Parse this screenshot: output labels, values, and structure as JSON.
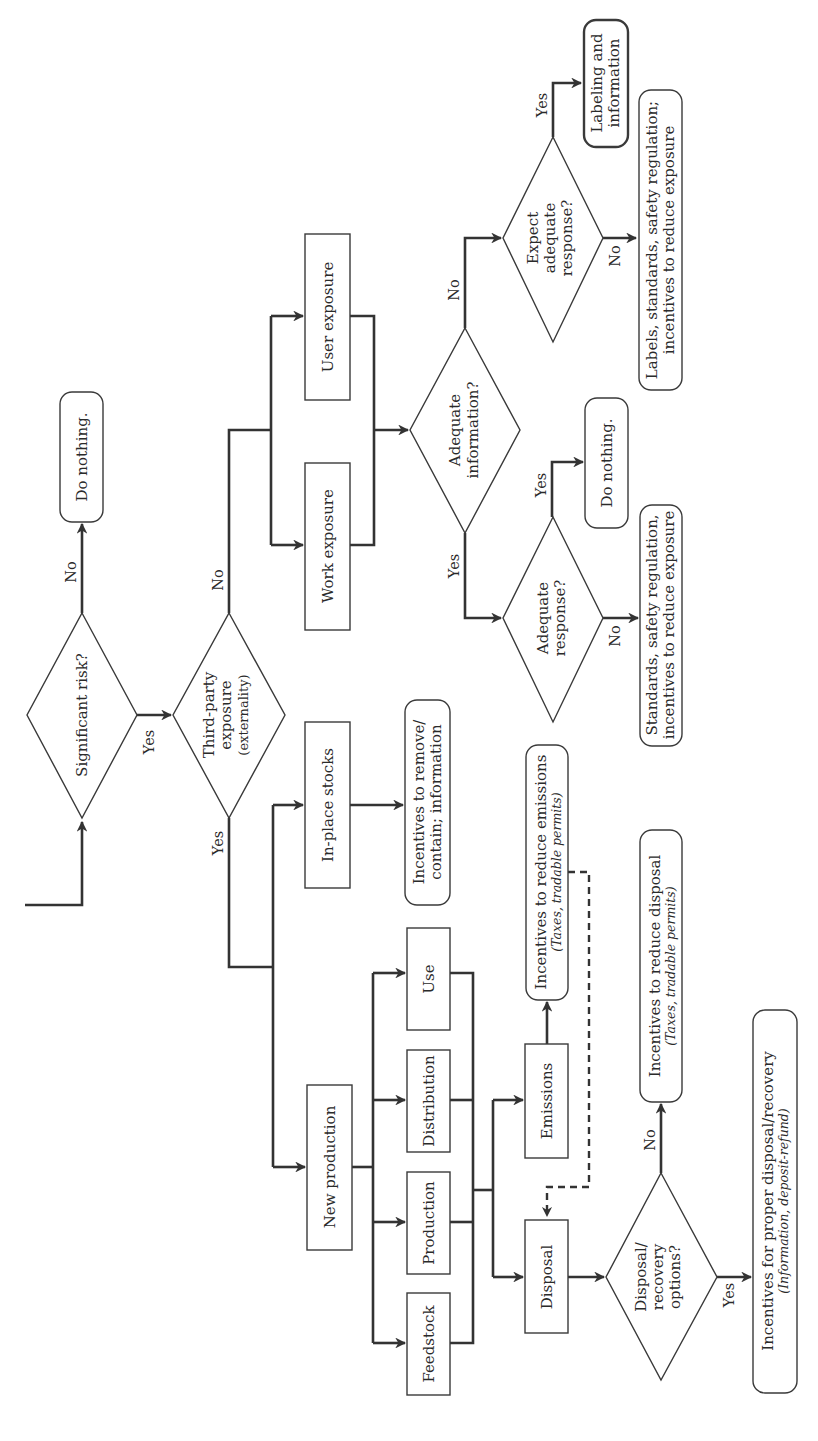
{
  "figure": {
    "orientation": "rotated 90 degrees counter-clockwise",
    "nodes": {
      "significant_risk": {
        "type": "decision",
        "lines": [
          "Significant risk?"
        ]
      },
      "do_nothing_1": {
        "type": "terminal",
        "lines": [
          "Do nothing."
        ]
      },
      "third_party": {
        "type": "decision",
        "lines": [
          "Third-party",
          "exposure",
          "(externality)"
        ]
      },
      "work_exposure": {
        "type": "process",
        "lines": [
          "Work exposure"
        ]
      },
      "user_exposure": {
        "type": "process",
        "lines": [
          "User exposure"
        ]
      },
      "adequate_information": {
        "type": "decision",
        "lines": [
          "Adequate",
          "information?"
        ]
      },
      "expect_adequate_response": {
        "type": "decision",
        "lines": [
          "Expect",
          "adequate",
          "response?"
        ]
      },
      "labeling_information": {
        "type": "terminal",
        "lines": [
          "Labeling and",
          "information"
        ]
      },
      "labels_standards": {
        "type": "terminal",
        "lines": [
          "Labels, standards, safety regulation;",
          "incentives to reduce exposure"
        ]
      },
      "adequate_response": {
        "type": "decision",
        "lines": [
          "Adequate",
          "response?"
        ]
      },
      "do_nothing_2": {
        "type": "terminal",
        "lines": [
          "Do nothing."
        ]
      },
      "standards_safety": {
        "type": "terminal",
        "lines": [
          "Standards, safety regulation,",
          "incentives to reduce exposure"
        ]
      },
      "in_place_stocks": {
        "type": "process",
        "lines": [
          "In-place stocks"
        ]
      },
      "incentives_remove": {
        "type": "terminal",
        "lines": [
          "Incentives to remove/",
          "contain; information"
        ]
      },
      "new_production": {
        "type": "process",
        "lines": [
          "New production"
        ]
      },
      "feedstock": {
        "type": "process",
        "lines": [
          "Feedstock"
        ]
      },
      "production": {
        "type": "process",
        "lines": [
          "Production"
        ]
      },
      "distribution": {
        "type": "process",
        "lines": [
          "Distribution"
        ]
      },
      "use": {
        "type": "process",
        "lines": [
          "Use"
        ]
      },
      "emissions": {
        "type": "process",
        "lines": [
          "Emissions"
        ]
      },
      "disposal": {
        "type": "process",
        "lines": [
          "Disposal"
        ]
      },
      "incentives_emissions": {
        "type": "terminal",
        "lines": [
          "Incentives to reduce emissions"
        ],
        "sub": [
          "(Taxes, ",
          "tradable permits)"
        ]
      },
      "disposal_recovery": {
        "type": "decision",
        "lines": [
          "Disposal/",
          "recovery",
          "options?"
        ]
      },
      "incentives_disposal": {
        "type": "terminal",
        "lines": [
          "Incentives to reduce disposal"
        ],
        "sub": [
          "(Taxes, ",
          "tradable permits)"
        ]
      },
      "incentives_proper": {
        "type": "terminal",
        "lines": [
          "Incentives for proper disposal/recovery"
        ],
        "sub": [
          "(Information, deposit-refund)",
          ""
        ]
      }
    },
    "edge_labels": {
      "sr_no": "No",
      "sr_yes": "Yes",
      "tp_no": "No",
      "tp_yes": "Yes",
      "ai_no": "No",
      "ai_yes": "Yes",
      "ear_yes": "Yes",
      "ear_no": "No",
      "ar_yes": "Yes",
      "ar_no": "No",
      "dr_no": "No",
      "dr_yes": "Yes"
    }
  }
}
